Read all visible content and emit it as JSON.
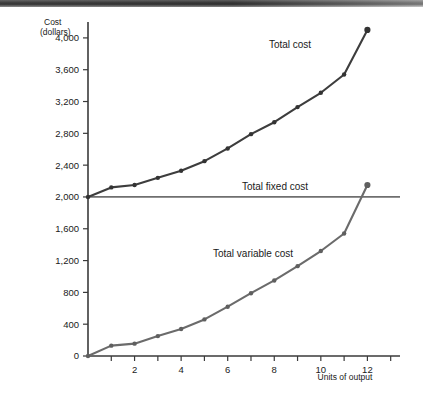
{
  "figure": {
    "background_color": "#ffffff",
    "scan_edge": true
  },
  "axes": {
    "y_title_line1": "Cost",
    "y_title_line2": "(dollars)",
    "x_title": "Units of output",
    "y_ticks": [
      "0",
      "400",
      "800",
      "1,200",
      "1,600",
      "2,000",
      "2,400",
      "2,800",
      "3,200",
      "3,600",
      "4,000"
    ],
    "x_ticks": [
      "2",
      "4",
      "6",
      "8",
      "10",
      "12"
    ]
  },
  "labels": {
    "total_cost": "Total cost",
    "total_fixed_cost": "Total fixed cost",
    "total_variable_cost": "Total variable cost"
  },
  "colors": {
    "total_cost": "#3d3d3d",
    "total_variable_cost": "#6b6b6b",
    "total_fixed_cost": "#6f6f6f",
    "axis": "#3a3a3a",
    "text": "#1a1a1a"
  },
  "chart_data": {
    "type": "line",
    "title": "",
    "xlabel": "Units of output",
    "ylabel": "Cost (dollars)",
    "xlim": [
      0,
      13.4
    ],
    "ylim": [
      0,
      4200
    ],
    "grid": false,
    "legend": "inline-annotations",
    "x": [
      0,
      1,
      2,
      3,
      4,
      5,
      6,
      7,
      8,
      9,
      10,
      11,
      12
    ],
    "series": [
      {
        "name": "Total cost",
        "color": "#3d3d3d",
        "markers": true,
        "values": [
          2000,
          2120,
          2150,
          2240,
          2330,
          2450,
          2610,
          2790,
          2940,
          3130,
          3310,
          3540,
          4100
        ]
      },
      {
        "name": "Total variable cost",
        "color": "#6b6b6b",
        "markers": true,
        "values": [
          0,
          130,
          155,
          250,
          340,
          460,
          620,
          790,
          950,
          1130,
          1320,
          1540,
          2150
        ]
      },
      {
        "name": "Total fixed cost",
        "color": "#6f6f6f",
        "markers": false,
        "values": [
          2000,
          2000,
          2000,
          2000,
          2000,
          2000,
          2000,
          2000,
          2000,
          2000,
          2000,
          2000,
          2000
        ]
      }
    ],
    "x_tick_values": [
      2,
      4,
      6,
      8,
      10,
      12
    ],
    "y_tick_values": [
      0,
      400,
      800,
      1200,
      1600,
      2000,
      2400,
      2800,
      3200,
      3600,
      4000
    ]
  }
}
